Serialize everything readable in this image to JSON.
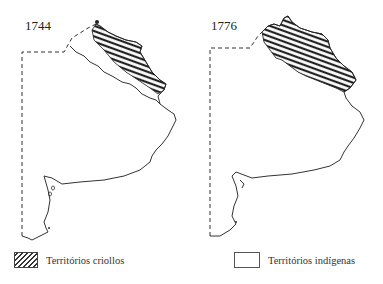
{
  "maps": [
    {
      "year": "1744",
      "hatched_region": "northeast (Buenos Aires / Litoral)"
    },
    {
      "year": "1776",
      "hatched_region": "northeast, extended southward"
    }
  ],
  "legend": {
    "criollos": {
      "label": "Territórios criollos",
      "pattern": "hatched"
    },
    "indigenas": {
      "label": "Territórios indígenas",
      "pattern": "blank"
    }
  },
  "colors": {
    "line": "#333333",
    "hatch": "#222222",
    "background": "#ffffff"
  }
}
